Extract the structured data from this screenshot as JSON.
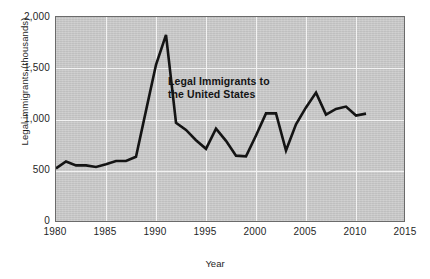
{
  "figure": {
    "background_color": "#ffffff",
    "plot_background_color": "#c9c9c9",
    "gridline_color": "#f2f2f2",
    "line_color": "#141414",
    "frame_color": "#6b6b6b"
  },
  "annotation": {
    "line1": "Legal Immigrants to",
    "line2": "the United States"
  },
  "chart_data": {
    "type": "line",
    "title": "",
    "annotations": [
      "Legal Immigrants to the United States"
    ],
    "xlabel": "Year",
    "ylabel": "Legal immigrants (thousands)",
    "xlim": [
      1980,
      2015
    ],
    "ylim": [
      0,
      2000
    ],
    "xticks": [
      1980,
      1985,
      1990,
      1995,
      2000,
      2005,
      2010,
      2015
    ],
    "xtick_labels": [
      "1980",
      "1985",
      "1990",
      "1995",
      "2000",
      "2005",
      "2010",
      "2015"
    ],
    "yticks": [
      0,
      500,
      1000,
      1500,
      2000
    ],
    "ytick_labels": [
      "0",
      "500",
      "1,000",
      "1,500",
      "2,000"
    ],
    "grid": true,
    "legend": "none",
    "series": [
      {
        "name": "Legal Immigrants to the United States",
        "color": "#141414",
        "x": [
          1980,
          1981,
          1982,
          1983,
          1984,
          1985,
          1986,
          1987,
          1988,
          1989,
          1990,
          1991,
          1992,
          1993,
          1994,
          1995,
          1996,
          1997,
          1998,
          1999,
          2000,
          2001,
          2002,
          2003,
          2004,
          2005,
          2006,
          2007,
          2008,
          2009,
          2010,
          2011
        ],
        "values": [
          530,
          597,
          559,
          559,
          544,
          570,
          602,
          602,
          643,
          1091,
          1536,
          1827,
          974,
          904,
          804,
          720,
          916,
          798,
          654,
          647,
          850,
          1064,
          1064,
          704,
          958,
          1122,
          1266,
          1052,
          1107,
          1130,
          1043,
          1062
        ]
      }
    ]
  }
}
